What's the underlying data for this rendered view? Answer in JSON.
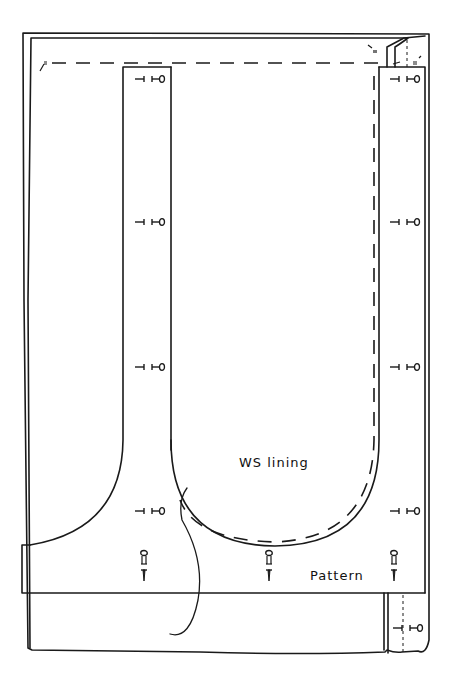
{
  "diagram": {
    "labels": {
      "lining": "WS lining",
      "pattern": "Pattern"
    },
    "colors": {
      "stroke": "#1a1a1a",
      "background": "#ffffff"
    },
    "pins": {
      "left_strip": [
        76,
        222,
        367,
        513
      ],
      "right_strip": [
        76,
        222,
        367,
        513
      ],
      "bottom_band_x": [
        145,
        269,
        395
      ],
      "lower_right_y": 628
    }
  }
}
